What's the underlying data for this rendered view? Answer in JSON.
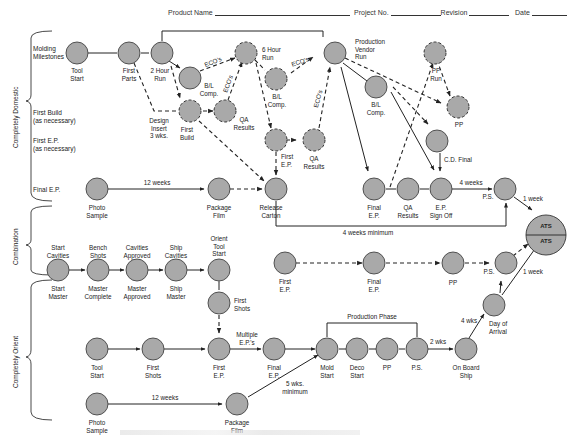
{
  "header": {
    "product_name_label": "Product Name",
    "project_no_label": "Project No.",
    "revision_label": "Revision",
    "date_label": "Date"
  },
  "sections": [
    {
      "name": "Completely Domestic",
      "rows": [
        "Molding Milestones",
        "First Build (as necessary)",
        "First E.P. (as necessary)",
        "Final E.P."
      ]
    },
    {
      "name": "Combination",
      "rows": []
    },
    {
      "name": "Completely Orient",
      "rows": []
    }
  ],
  "row_labels": {
    "molding_milestones": [
      "Molding",
      "Milestones"
    ],
    "first_build": [
      "First Build",
      "(as necessary)"
    ],
    "first_ep": [
      "First E.P.",
      "(as necessary)"
    ],
    "final_ep": [
      "Final E.P."
    ]
  },
  "nodes": {
    "dom_tool_start": "Tool|Start",
    "dom_first_parts": "First|Parts",
    "dom_2hr_run": "2 Hour|Run",
    "dom_bl_comp1": "B/L|Comp.",
    "dom_design_insert": "Design|Insert|3 wks.",
    "dom_first_build": "First|Build",
    "dom_qa_results1": "QA|Results",
    "dom_6hr_run": "6 Hour|Run",
    "dom_bl_comp2": "B/L|Comp.",
    "dom_first_ep": "First|E.P.",
    "dom_qa_results2": "QA|Results",
    "dom_prod_vendor_run": "Production|Vendor|Run",
    "dom_bl_comp3": "B/L|Comp.",
    "dom_pp_run": "PP|Run",
    "dom_pp": "PP",
    "dom_cd_final": "C.D. Final",
    "dom_photo_sample": "Photo|Sample",
    "dom_package_film": "Package|Film",
    "dom_release_carton": "Release|Carton",
    "dom_final_ep": "Final|E.P.",
    "dom_qa_results3": "QA|Results",
    "dom_ep_signoff": "E.P.|Sign Off",
    "dom_ps": "P.S.",
    "comb_start_cavities": "Start|Cavities",
    "comb_start_master": "Start|Master",
    "comb_bench_shots": "Bench|Shots",
    "comb_master_complete": "Master|Complete",
    "comb_cavities_approved": "Cavities|Approved",
    "comb_master_approved": "Master|Approved",
    "comb_ship_cavities": "Ship|Cavities",
    "comb_ship_master": "Ship|Master",
    "comb_orient_tool_start": "Orient|Tool|Start",
    "comb_first_shots": "First|Shots",
    "comb_first_ep": "First|E.P.",
    "comb_final_ep": "Final|E.P.",
    "comb_pp": "PP",
    "comb_ps": "P.S.",
    "ori_tool_start": "Tool|Start",
    "ori_first_shots": "First|Shots",
    "ori_first_ep": "First|E.P.",
    "ori_final_ep": "Final|E.P.",
    "ori_mold_start": "Mold|Start",
    "ori_deco_start": "Deco|Start",
    "ori_pp": "PP",
    "ori_ps": "P.S.",
    "ori_on_board_ship": "On Board|Ship",
    "ori_day_of_arrival": "Day of|Arrival",
    "ori_photo_sample": "Photo|Sample",
    "ori_package_film": "Package|Film",
    "ats_top": "ATS",
    "ats_bottom": "ATS"
  },
  "edge_labels": {
    "ecos_1": "ECO's",
    "ecos_2": "ECO's",
    "ecos_3": "ECO's",
    "ecos_4": "ECO's",
    "dom_12_weeks": "12 weeks",
    "dom_4_weeks": "4 weeks",
    "dom_4_weeks_min": "4 weeks minimum",
    "dom_1_week": "1 week",
    "comb_1_week": "1 week",
    "multiple_eps": "Multiple|E.P.'s",
    "ori_12_weeks": "12 weeks",
    "ori_5_wks_min": "5 wks.|minimum",
    "production_phase": "Production Phase",
    "ori_2_wks": "2 wks",
    "ori_4_wks": "4 wks"
  },
  "colors": {
    "node_fill": "#a9a9a9",
    "node_stroke": "#444444",
    "line": "#222222"
  }
}
